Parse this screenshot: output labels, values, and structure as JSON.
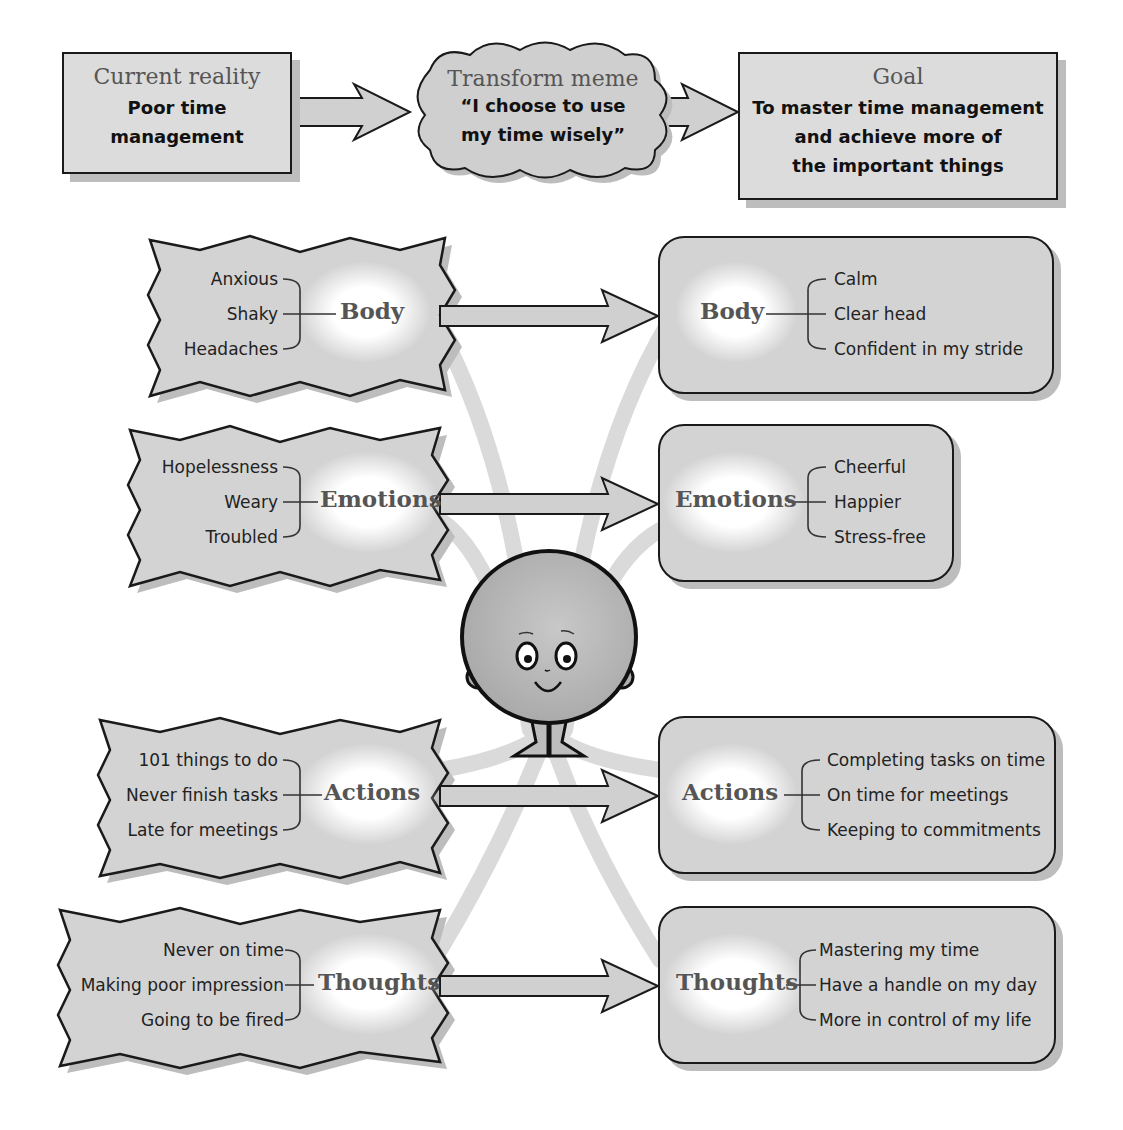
{
  "top_flow": {
    "current_reality": {
      "title": "Current reality",
      "lines": [
        "Poor time",
        "management"
      ]
    },
    "transform_meme": {
      "title": "Transform meme",
      "lines": [
        "“I choose to use",
        "my time wisely”"
      ]
    },
    "goal": {
      "title": "Goal",
      "lines": [
        "To master time management",
        "and achieve more of",
        "the important things"
      ]
    }
  },
  "before": [
    {
      "category": "Body",
      "items": [
        "Anxious",
        "Shaky",
        "Headaches"
      ]
    },
    {
      "category": "Emotions",
      "items": [
        "Hopelessness",
        "Weary",
        "Troubled"
      ]
    },
    {
      "category": "Actions",
      "items": [
        "101 things to do",
        "Never finish tasks",
        "Late for meetings"
      ]
    },
    {
      "category": "Thoughts",
      "items": [
        "Never on time",
        "Making poor impression",
        "Going to be fired"
      ]
    }
  ],
  "after": [
    {
      "category": "Body",
      "items": [
        "Calm",
        "Clear head",
        "Confident in my stride"
      ]
    },
    {
      "category": "Emotions",
      "items": [
        "Cheerful",
        "Happier",
        "Stress-free"
      ]
    },
    {
      "category": "Actions",
      "items": [
        "Completing tasks on time",
        "On time for meetings",
        "Keeping to commitments"
      ]
    },
    {
      "category": "Thoughts",
      "items": [
        "Mastering my time",
        "Have a handle on my day",
        "More in control of my life"
      ]
    }
  ],
  "character": {
    "icon": "smiling-round-character-icon"
  },
  "colors": {
    "box_fill": "#d3d3d3",
    "top_box_fill": "#dcdcdc",
    "outline": "#1a1a1a",
    "shadow": "#bdbdbd",
    "title_gray": "#555555",
    "rays": "#d9d9d9"
  }
}
